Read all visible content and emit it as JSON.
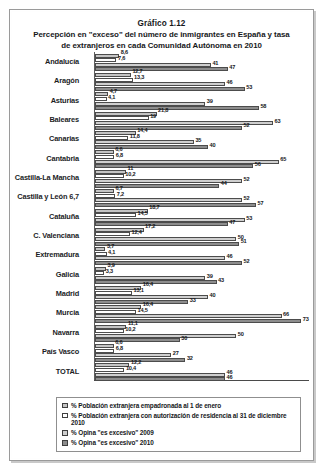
{
  "figure": {
    "number": "Gráfico 1.12",
    "title_line1": "Percepción en \"exceso\" del número de inmigrantes en España y tasa",
    "title_line2": "de extranjeros en cada Comunidad Autónoma en 2010"
  },
  "legend": {
    "items": [
      {
        "swatch": "light-gray-square",
        "label": "% Población extranjera empadronada al 1 de enero"
      },
      {
        "swatch": "white-square",
        "label": "% Población extranjera con autorización de residencia al 31 de diciembre 2010"
      },
      {
        "swatch": "light-gray-square",
        "label": "% Opina \"es excesivo\" 2009"
      },
      {
        "swatch": "dark-gray-square",
        "label": "% Opina \"es excesivo\" 2010"
      }
    ]
  },
  "colors": {
    "series0": "#c4c4c4",
    "series1": "#ffffff",
    "series2": "#cfcfcf",
    "series3": "#8d8d8d",
    "frame": "#9a9a9a",
    "text": "#15171a"
  },
  "chart_data": {
    "type": "bar",
    "orientation": "horizontal",
    "title": "Percepción en \"exceso\" del número de inmigrantes en España y tasa de extranjeros en cada Comunidad Autónoma en 2010",
    "xlabel": "",
    "ylabel": "",
    "xlim": [
      0,
      75
    ],
    "grid": false,
    "legend_position": "bottom",
    "categories": [
      "Andalucía",
      "Aragón",
      "Asturias",
      "Baleares",
      "Canarias",
      "Cantabria",
      "Castilla-La Mancha",
      "Castilla y León 6,7",
      "Cataluña",
      "C. Valenciana",
      "Extremadura",
      "Galicia",
      "Madrid",
      "Murcia",
      "Navarra",
      "País Vasco",
      "TOTAL"
    ],
    "series": [
      {
        "name": "% Población extranjera empadronada al 1 de enero",
        "values": [
          8.6,
          12.7,
          4.7,
          21.8,
          14.4,
          6.6,
          11,
          6.7,
          18.7,
          17.2,
          3.7,
          3.9,
          16.4,
          16.4,
          11.1,
          6.6,
          12.2
        ],
        "labels": [
          "8,6",
          "12,7",
          "4,7",
          "21,8",
          "14,4",
          "6,6",
          "11",
          "6,7",
          "18,7",
          "17,2",
          "3,7",
          "3,9",
          "16,4",
          "16,4",
          "11,1",
          "6,6",
          "12,2"
        ]
      },
      {
        "name": "% Población extranjera con autorización de residencia al 31 de diciembre 2010",
        "values": [
          7.6,
          13.3,
          4.1,
          19,
          11.8,
          6.8,
          10.2,
          7.2,
          14.5,
          12.4,
          4.1,
          3.3,
          13.1,
          14.5,
          10.2,
          6.8,
          10.4
        ],
        "labels": [
          "7,6",
          "13,3",
          "4,1",
          "19",
          "11,8",
          "6,8",
          "10,2",
          "7,2",
          "14,5",
          "12,4",
          "4,1",
          "3,3",
          "13,1",
          "14,5",
          "10,2",
          "6,8",
          "10,4"
        ]
      },
      {
        "name": "% Opina \"es excesivo\" 2009",
        "values": [
          41,
          46,
          39,
          63,
          35,
          65,
          52,
          52,
          53,
          50,
          46,
          39,
          40,
          66,
          50,
          27,
          46
        ],
        "labels": [
          "41",
          "46",
          "39",
          "63",
          "35",
          "65",
          "52",
          "52",
          "53",
          "50",
          "46",
          "39",
          "40",
          "66",
          "50",
          "27",
          "46"
        ]
      },
      {
        "name": "% Opina \"es excesivo\" 2010",
        "values": [
          47,
          53,
          58,
          52,
          40,
          56,
          44,
          57,
          47,
          51,
          52,
          43,
          33,
          73,
          30,
          32,
          46
        ],
        "labels": [
          "47",
          "53",
          "58",
          "52",
          "40",
          "56",
          "44",
          "57",
          "47",
          "51",
          "52",
          "43",
          "33",
          "73",
          "30",
          "32",
          "46"
        ]
      }
    ]
  }
}
